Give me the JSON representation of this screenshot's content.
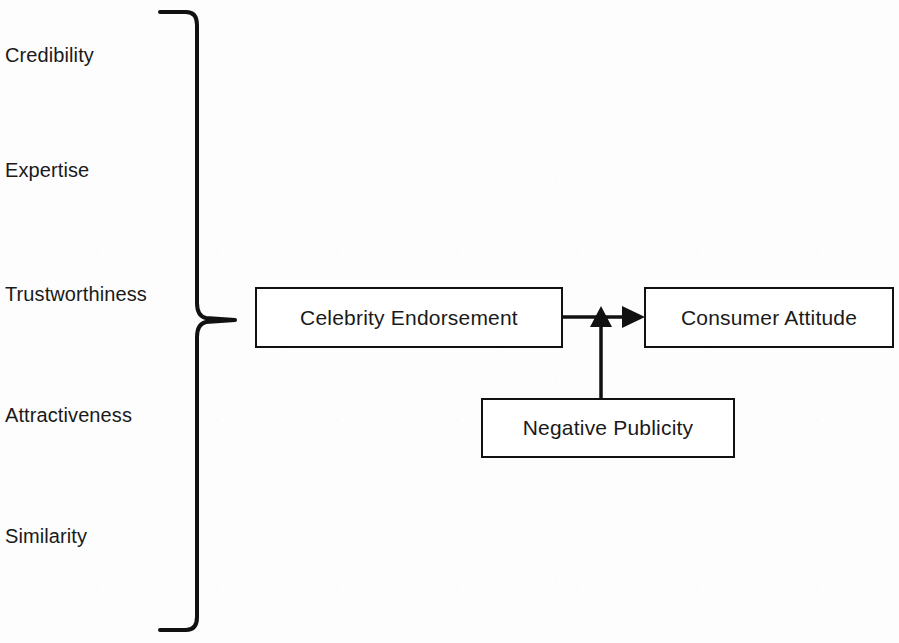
{
  "diagram": {
    "background_color": "#fdfdfd",
    "line_color": "#111111",
    "text_color": "#1a1a1a",
    "brace": {
      "name": "left-curly-brace",
      "orientation": "right-pointing",
      "groups_labels": [
        "Credibility",
        "Expertise",
        "Trustworthiness",
        "Attractiveness",
        "Similarity"
      ],
      "points_to": "Celebrity Endorsement"
    },
    "attribute_labels": [
      {
        "text": "Credibility",
        "x": 5,
        "y": 45
      },
      {
        "text": "Expertise",
        "x": 5,
        "y": 160
      },
      {
        "text": "Trustworthiness",
        "x": 5,
        "y": 284
      },
      {
        "text": "Attractiveness",
        "x": 5,
        "y": 405
      },
      {
        "text": "Similarity",
        "x": 5,
        "y": 526
      }
    ],
    "nodes": [
      {
        "id": "celebrity-endorsement",
        "label": "Celebrity Endorsement",
        "x": 255,
        "y": 287,
        "w": 308,
        "h": 61
      },
      {
        "id": "consumer-attitude",
        "label": "Consumer Attitude",
        "x": 644,
        "y": 287,
        "w": 250,
        "h": 61
      },
      {
        "id": "negative-publicity",
        "label": "Negative Publicity",
        "x": 481,
        "y": 398,
        "w": 254,
        "h": 60
      }
    ],
    "arrows": [
      {
        "id": "endorsement-to-attitude",
        "from": "celebrity-endorsement",
        "to": "consumer-attitude",
        "direction": "right",
        "label": ""
      },
      {
        "id": "publicity-to-link",
        "from": "negative-publicity",
        "to": "endorsement-to-attitude",
        "direction": "up",
        "label": ""
      }
    ]
  }
}
